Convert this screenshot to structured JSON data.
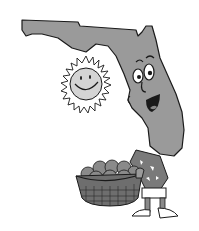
{
  "illustration": {
    "subject": "Cartoon Florida state character holding a basket of oranges with a smiling sun",
    "colors": {
      "state_fill": "#9a9a9a",
      "outline": "#1a1a1a",
      "sun_fill": "#d4d4d4",
      "orange_fill": "#8a8a8a",
      "basket_fill": "#6e6e6e",
      "background": "#ffffff"
    }
  }
}
